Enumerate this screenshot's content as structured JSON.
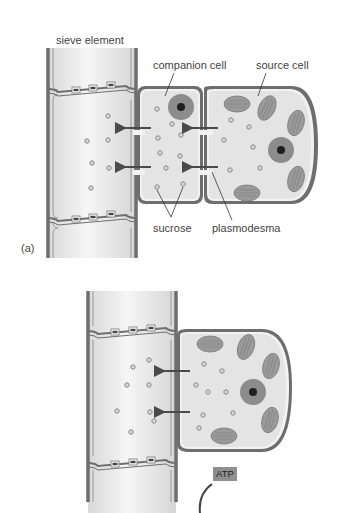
{
  "panel_a": {
    "panel_label": "(a)",
    "labels": {
      "sieve_element": "sieve element",
      "companion_cell": "companion cell",
      "source_cell": "source cell",
      "sucrose": "sucrose",
      "plasmodesma": "plasmodesma"
    }
  },
  "panel_b": {
    "atp_label": "ATP"
  },
  "colors": {
    "wall": "#6e6e6e",
    "cytoplasm": "#e6e6e6",
    "chloroplast": "#9a9a9a",
    "nucleus_outer": "#8a8a8a",
    "nucleus_inner": "#1e1e1e",
    "sucrose": "#8a8a8a",
    "arrow": "#4a4a4a"
  }
}
